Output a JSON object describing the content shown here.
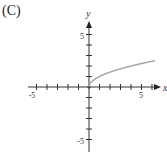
{
  "label": "(C)",
  "chart_data": {
    "type": "line",
    "title": "",
    "xlabel": "x",
    "ylabel": "y",
    "xlim": [
      -5.5,
      6.5
    ],
    "ylim": [
      -6,
      6
    ],
    "x_ticks_labeled": [
      "-5",
      "5"
    ],
    "y_ticks_labeled": [
      "5",
      "-5"
    ],
    "series": [
      {
        "name": "y = sqrt(x)",
        "x": [
          0,
          1,
          2,
          3,
          4,
          5,
          6.3
        ],
        "y": [
          0,
          1,
          1.41,
          1.73,
          2,
          2.24,
          2.51
        ],
        "color": "#a0a0a0"
      }
    ],
    "grid": false
  }
}
